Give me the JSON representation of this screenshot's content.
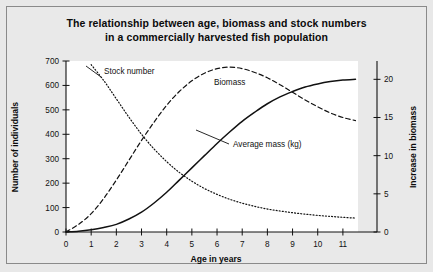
{
  "figure": {
    "title_line_1": "The relationship between age, biomass and stock numbers",
    "title_line_2": "in a commercially harvested fish population",
    "background_color": "#e8e8e8",
    "plot_background_color": "#ffffff",
    "frame_color": "#8a8a8a",
    "ink_color": "#111111"
  },
  "chart_data": {
    "type": "line",
    "title": "The relationship between age, biomass and stock numbers in a commercially harvested fish population",
    "xlabel": "Age in years",
    "ylabel": "Number of individuals",
    "y2label": "Increase in biomass",
    "xlim": [
      0,
      11.6
    ],
    "ylim": [
      0,
      700
    ],
    "y2lim": [
      0,
      22.4
    ],
    "grid": false,
    "legend": "inline-labels",
    "xticks": [
      0,
      1,
      2,
      3,
      4,
      5,
      6,
      7,
      8,
      9,
      10,
      11
    ],
    "xtick_labels": [
      "0",
      "1",
      "2",
      "3",
      "4",
      "5",
      "6",
      "7",
      "8",
      "9",
      "10",
      "11"
    ],
    "yticks": [
      0,
      100,
      200,
      300,
      400,
      500,
      600,
      700
    ],
    "ytick_labels": [
      "0",
      "100",
      "200",
      "300",
      "400",
      "500",
      "600",
      "700"
    ],
    "y2ticks": [
      0,
      5,
      10,
      15,
      20
    ],
    "y2tick_labels": [
      "0",
      "5",
      "10",
      "15",
      "20"
    ],
    "series": [
      {
        "name": "Stock number",
        "label": "Stock number",
        "axis": "left",
        "style": "dotted",
        "x": [
          1.0,
          1.5,
          2.0,
          2.5,
          3.0,
          3.5,
          4.0,
          4.5,
          5.0,
          5.5,
          6.0,
          6.5,
          7.0,
          7.5,
          8.0,
          8.5,
          9.0,
          9.5,
          10.0,
          10.5,
          11.0,
          11.5
        ],
        "values": [
          685,
          620,
          545,
          470,
          400,
          340,
          288,
          244,
          208,
          178,
          154,
          134,
          118,
          105,
          94,
          86,
          79,
          73,
          68,
          64,
          60,
          57
        ]
      },
      {
        "name": "Biomass",
        "label": "Biomass",
        "axis": "right",
        "style": "dashed",
        "x": [
          0.0,
          0.5,
          1.0,
          1.5,
          2.0,
          2.5,
          3.0,
          3.5,
          4.0,
          4.5,
          5.0,
          5.5,
          6.0,
          6.5,
          7.0,
          7.5,
          8.0,
          8.5,
          9.0,
          9.5,
          10.0,
          10.5,
          11.0,
          11.5
        ],
        "values": [
          0.0,
          1.0,
          2.4,
          4.4,
          6.8,
          9.4,
          12.0,
          14.4,
          16.6,
          18.4,
          19.8,
          20.8,
          21.4,
          21.6,
          21.4,
          20.9,
          20.2,
          19.3,
          18.3,
          17.3,
          16.4,
          15.6,
          15.0,
          14.6
        ]
      },
      {
        "name": "Average mass (kg)",
        "label": "Average mass (kg)",
        "axis": "right",
        "style": "solid",
        "x": [
          0.0,
          0.5,
          1.0,
          1.5,
          2.0,
          2.5,
          3.0,
          3.5,
          4.0,
          4.5,
          5.0,
          5.5,
          6.0,
          6.5,
          7.0,
          7.5,
          8.0,
          8.5,
          9.0,
          9.5,
          10.0,
          10.5,
          11.0,
          11.5
        ],
        "values": [
          0.0,
          0.1,
          0.3,
          0.6,
          1.0,
          1.7,
          2.6,
          3.8,
          5.2,
          6.8,
          8.4,
          10.0,
          11.6,
          13.1,
          14.5,
          15.7,
          16.8,
          17.7,
          18.4,
          19.0,
          19.4,
          19.7,
          19.9,
          20.0
        ]
      }
    ],
    "annotations": [
      {
        "text": "Stock number",
        "x_px": 104,
        "y_px": 74
      },
      {
        "text": "Biomass",
        "x_px": 214,
        "y_px": 85
      },
      {
        "text": "Average mass (kg)",
        "x_px": 233,
        "y_px": 147
      }
    ]
  }
}
